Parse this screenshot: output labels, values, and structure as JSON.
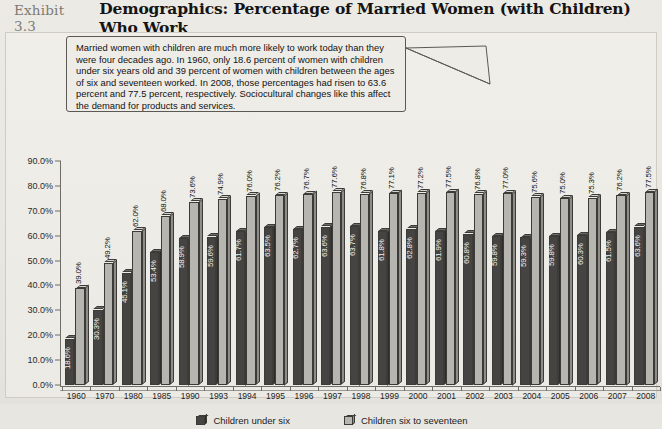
{
  "exhibit": {
    "number_label": "Exhibit 3.3",
    "title": "Demographics: Percentage of Married Women (with Children) Who Work"
  },
  "annotation": {
    "text": "Married women with children are much more likely to work today than they were four decades ago. In 1960, only 18.6 percent of women with children under six years old and 39 percent of women with children between the ages of six and seventeen worked. In 2008, those percentages had risen to 63.6 percent and 77.5 percent, respectively. Sociocultural changes like this affect the demand for products and services."
  },
  "colors": {
    "series_under_six": "#464442",
    "series_six_to_seventeen": "#b6b5b0",
    "background": "#eceae5",
    "axis": "#6f6d68"
  },
  "chart_data": {
    "type": "bar",
    "title": "Demographics: Percentage of Married Women (with Children) Who Work",
    "xlabel": "",
    "ylabel": "",
    "ylim": [
      0,
      90
    ],
    "grid": false,
    "legend_position": "bottom",
    "ytick_labels": [
      "90.0%",
      "80.0%",
      "70.0%",
      "60.0%",
      "50.0%",
      "40.0%",
      "30.0%",
      "20.0%",
      "10.0%",
      "0.0%"
    ],
    "ytick_values": [
      90,
      80,
      70,
      60,
      50,
      40,
      30,
      20,
      10,
      0
    ],
    "categories": [
      "1960",
      "1970",
      "1980",
      "1985",
      "1990",
      "1993",
      "1994",
      "1995",
      "1996",
      "1997",
      "1998",
      "1999",
      "2000",
      "2001",
      "2002",
      "2003",
      "2004",
      "2005",
      "2006",
      "2007",
      "2008"
    ],
    "series": [
      {
        "name": "Children under six",
        "values": [
          18.6,
          30.3,
          45.1,
          53.4,
          58.9,
          59.6,
          61.7,
          63.5,
          62.7,
          63.6,
          63.7,
          61.8,
          62.8,
          61.9,
          60.8,
          59.8,
          59.3,
          59.8,
          60.3,
          61.5,
          63.6
        ],
        "labels": [
          "18.6%",
          "30.3%",
          "45.1%",
          "53.4%",
          "58.9%",
          "59.6%",
          "61.7%",
          "63.5%",
          "62.7%",
          "63.6%",
          "63.7%",
          "61.8%",
          "62.8%",
          "61.9%",
          "60.8%",
          "59.8%",
          "59.3%",
          "59.8%",
          "60.3%",
          "61.5%",
          "63.6%"
        ]
      },
      {
        "name": "Children six to seventeen",
        "values": [
          39.0,
          49.2,
          62.0,
          68.0,
          73.6,
          74.9,
          76.0,
          76.2,
          76.7,
          77.6,
          76.8,
          77.1,
          77.2,
          77.5,
          76.8,
          77.0,
          75.6,
          75.0,
          75.3,
          76.2,
          77.5
        ],
        "labels": [
          "39.0%",
          "49.2%",
          "62.0%",
          "68.0%",
          "73.6%",
          "74.9%",
          "76.0%",
          "76.2%",
          "76.7%",
          "77.6%",
          "76.8%",
          "77.1%",
          "77.2%",
          "77.5%",
          "76.8%",
          "77.0%",
          "75.6%",
          "75.0%",
          "75.3%",
          "76.2%",
          "77.5%"
        ]
      }
    ],
    "legend": [
      "Children under six",
      "Children six to seventeen"
    ]
  }
}
